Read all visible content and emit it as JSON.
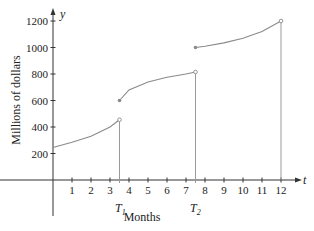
{
  "chart_data": {
    "type": "line",
    "title": "",
    "xlabel": "Months",
    "ylabel": "Millions of dollars",
    "x_axis_var": "t",
    "y_axis_var": "y",
    "xlim": [
      0,
      12.5
    ],
    "ylim": [
      0,
      1250
    ],
    "x_ticks": [
      1,
      2,
      3,
      4,
      5,
      6,
      7,
      8,
      9,
      10,
      11,
      12
    ],
    "y_ticks": [
      200,
      400,
      600,
      800,
      1000,
      1200
    ],
    "x_annotations": [
      {
        "label": "T",
        "subscript": "1",
        "x": 3.5
      },
      {
        "label": "T",
        "subscript": "2",
        "x": 7.5
      }
    ],
    "series": [
      {
        "name": "segment-1",
        "x": [
          0,
          1,
          2,
          3,
          3.5
        ],
        "values": [
          245,
          285,
          330,
          400,
          455
        ],
        "end": "open"
      },
      {
        "name": "segment-2",
        "x": [
          3.5,
          4,
          5,
          6,
          7,
          7.5
        ],
        "values": [
          600,
          680,
          740,
          775,
          800,
          815
        ],
        "start": "closed",
        "end": "open"
      },
      {
        "name": "segment-3",
        "x": [
          7.5,
          8,
          9,
          10,
          11,
          12
        ],
        "values": [
          1000,
          1010,
          1035,
          1070,
          1120,
          1200
        ],
        "start": "closed",
        "end": "open"
      }
    ],
    "vertical_lines": [
      3.5,
      7.5,
      12
    ],
    "grid": false,
    "legend": "none"
  },
  "labels": {
    "y_var": "y",
    "t_var": "t",
    "xlabel": "Months",
    "ylabel": "Millions of dollars",
    "T1": "T",
    "T1_sub": "1",
    "T2": "T",
    "T2_sub": "2"
  },
  "colors": {
    "curve": "#8a8a8a",
    "axis": "#333333",
    "vertical": "#9a9a9a"
  }
}
